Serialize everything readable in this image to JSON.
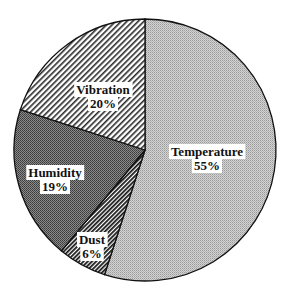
{
  "chart_data": {
    "type": "pie",
    "title": "",
    "start_angle_deg_from_top": 0,
    "direction": "clockwise",
    "slices": [
      {
        "label": "Temperature",
        "value": 55,
        "value_label": "55%",
        "pattern": "fine-dots-light"
      },
      {
        "label": "Dust",
        "value": 6,
        "value_label": "6%",
        "pattern": "dense-diagonal-dark"
      },
      {
        "label": "Humidity",
        "value": 19,
        "value_label": "19%",
        "pattern": "checker-dark"
      },
      {
        "label": "Vibration",
        "value": 20,
        "value_label": "20%",
        "pattern": "diagonal-hatch"
      }
    ],
    "legend": "none",
    "labels_inside": true
  }
}
